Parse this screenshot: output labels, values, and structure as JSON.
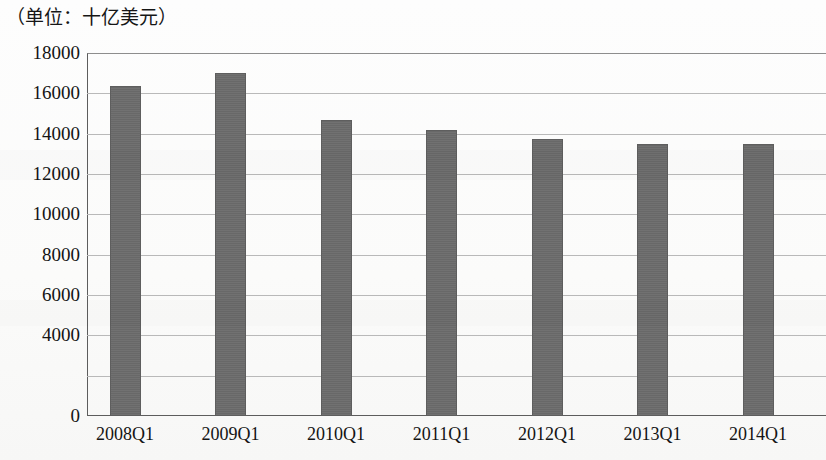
{
  "unit_caption": "（单位：十亿美元）",
  "chart_data": {
    "type": "bar",
    "title": "",
    "subtitle": "",
    "unit_note": "（单位：十亿美元）",
    "xlabel": "",
    "ylabel": "",
    "categories": [
      "2008Q1",
      "2009Q1",
      "2010Q1",
      "2011Q1",
      "2012Q1",
      "2013Q1",
      "2014Q1"
    ],
    "values": [
      16350,
      17000,
      14700,
      14200,
      13750,
      13500,
      13500
    ],
    "series": [
      {
        "name": "",
        "values": [
          16350,
          17000,
          14700,
          14200,
          13750,
          13500,
          13500
        ]
      }
    ],
    "ylim": [
      0,
      18000
    ],
    "ytick_values": [
      0,
      2000,
      4000,
      6000,
      8000,
      10000,
      12000,
      14000,
      16000,
      18000
    ],
    "ytick_labels": [
      "0",
      "",
      "4000",
      "6000",
      "8000",
      "10000",
      "12000",
      "14000",
      "16000",
      "18000"
    ],
    "grid": true,
    "grid_axis": "y",
    "legend": false,
    "legend_position": "none",
    "bar_color": "#6b6b6b",
    "gridline_color": "#b9b9b9",
    "axis_color": "#5d5d5d",
    "background_color": "#fdfdfd",
    "annotations": []
  }
}
